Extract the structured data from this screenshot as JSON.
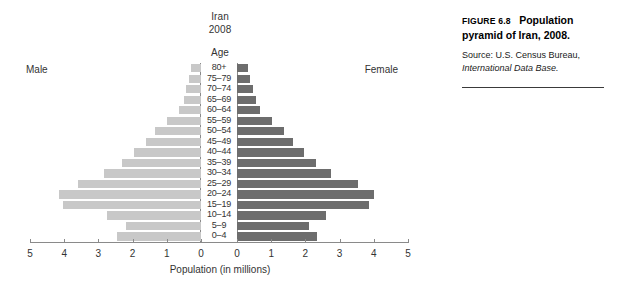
{
  "figure": {
    "title_line1": "Iran",
    "title_line2": "2008",
    "age_axis_label": "Age",
    "male_label": "Male",
    "female_label": "Female",
    "xaxis_title": "Population (in millions)"
  },
  "caption": {
    "figure_number": "FIGURE 6.8",
    "figure_title": "Population pyramid of Iran, 2008.",
    "source_prefix": "Source: U.S. Census Bureau, ",
    "source_italic": "International Data Base."
  },
  "colors": {
    "male_bar": "#c8c8c8",
    "female_bar": "#6d6d6d",
    "axis": "#8a8a8a",
    "text": "#333333"
  },
  "chart_data": {
    "type": "bar",
    "subtype": "population-pyramid",
    "title": "Iran 2008",
    "xlabel": "Population (in millions)",
    "ylabel": "Age",
    "xlim": [
      0,
      5
    ],
    "grid": false,
    "tick_values": [
      5,
      4,
      3,
      2,
      1,
      0,
      0,
      1,
      2,
      3,
      4,
      5
    ],
    "tick_labels": [
      "5",
      "4",
      "3",
      "2",
      "1",
      "0",
      "0",
      "1",
      "2",
      "3",
      "4",
      "5"
    ],
    "categories": [
      "80+",
      "75–79",
      "70–74",
      "65–69",
      "60–64",
      "55–59",
      "50–54",
      "45–49",
      "40–44",
      "35–39",
      "30–34",
      "25–29",
      "20–24",
      "15–19",
      "10–14",
      "5–9",
      "0–4"
    ],
    "series": [
      {
        "name": "Male",
        "side": "left",
        "color": "#c8c8c8",
        "values": [
          0.3,
          0.35,
          0.45,
          0.5,
          0.65,
          1.0,
          1.35,
          1.6,
          1.95,
          2.3,
          2.85,
          3.6,
          4.15,
          4.05,
          2.75,
          2.2,
          2.45
        ]
      },
      {
        "name": "Female",
        "side": "right",
        "color": "#6d6d6d",
        "values": [
          0.32,
          0.37,
          0.48,
          0.55,
          0.68,
          1.02,
          1.38,
          1.65,
          1.95,
          2.3,
          2.75,
          3.55,
          4.0,
          3.85,
          2.6,
          2.1,
          2.35
        ]
      }
    ]
  }
}
